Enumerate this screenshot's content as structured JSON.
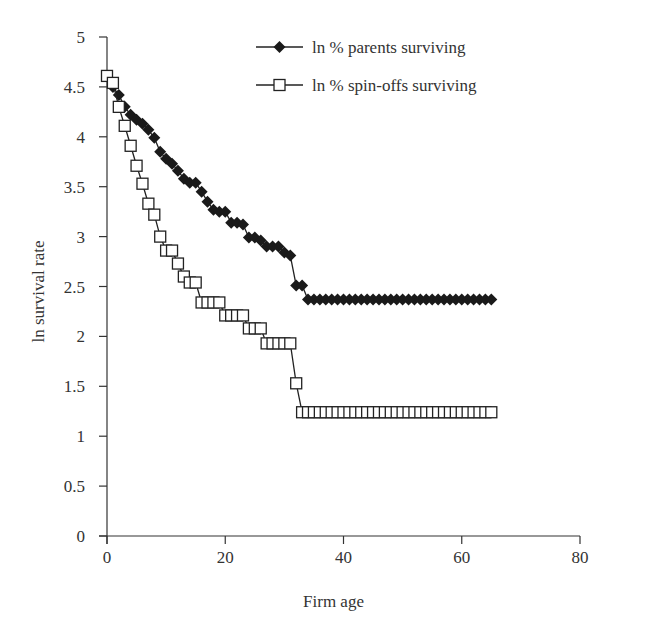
{
  "chart_data": {
    "type": "line",
    "title": "",
    "xlabel": "Firm age",
    "ylabel": "ln survival rate",
    "xlim": [
      0,
      80
    ],
    "ylim": [
      0,
      5
    ],
    "x_ticks": [
      0,
      20,
      40,
      60,
      80
    ],
    "x_tick_labels": [
      "0",
      "20",
      "40",
      "60",
      "80"
    ],
    "y_ticks": [
      0,
      0.5,
      1,
      1.5,
      2,
      2.5,
      3,
      3.5,
      4,
      4.5,
      5
    ],
    "y_tick_labels": [
      "0",
      "0.5",
      "1",
      "1.5",
      "2",
      "2.5",
      "3",
      "3.5",
      "4",
      "4.5",
      "5"
    ],
    "grid": false,
    "legend_position": "top-right",
    "x": [
      0,
      1,
      2,
      3,
      4,
      5,
      6,
      7,
      8,
      9,
      10,
      11,
      12,
      13,
      14,
      15,
      16,
      17,
      18,
      19,
      20,
      21,
      22,
      23,
      24,
      25,
      26,
      27,
      28,
      29,
      30,
      31,
      32,
      33,
      34,
      35,
      36,
      37,
      38,
      39,
      40,
      41,
      42,
      43,
      44,
      45,
      46,
      47,
      48,
      49,
      50,
      51,
      52,
      53,
      54,
      55,
      56,
      57,
      58,
      59,
      60,
      61,
      62,
      63,
      64,
      65
    ],
    "series": [
      {
        "name": "ln % parents surviving",
        "marker": "filled-diamond",
        "color": "#1a1a1a",
        "values": [
          4.61,
          4.5,
          4.42,
          4.3,
          4.22,
          4.17,
          4.13,
          4.07,
          3.99,
          3.85,
          3.78,
          3.73,
          3.66,
          3.58,
          3.54,
          3.54,
          3.45,
          3.35,
          3.27,
          3.25,
          3.25,
          3.14,
          3.14,
          3.12,
          2.99,
          2.99,
          2.96,
          2.9,
          2.9,
          2.9,
          2.84,
          2.81,
          2.51,
          2.51,
          2.37,
          2.37,
          2.37,
          2.37,
          2.37,
          2.37,
          2.37,
          2.37,
          2.37,
          2.37,
          2.37,
          2.37,
          2.37,
          2.37,
          2.37,
          2.37,
          2.37,
          2.37,
          2.37,
          2.37,
          2.37,
          2.37,
          2.37,
          2.37,
          2.37,
          2.37,
          2.37,
          2.37,
          2.37,
          2.37,
          2.37,
          2.37
        ]
      },
      {
        "name": "ln % spin-offs surviving",
        "marker": "open-square",
        "color": "#1a1a1a",
        "values": [
          4.61,
          4.54,
          4.3,
          4.11,
          3.91,
          3.71,
          3.53,
          3.33,
          3.22,
          3.0,
          2.86,
          2.86,
          2.73,
          2.6,
          2.54,
          2.54,
          2.34,
          2.34,
          2.34,
          2.34,
          2.21,
          2.21,
          2.21,
          2.21,
          2.08,
          2.08,
          2.08,
          1.93,
          1.93,
          1.93,
          1.93,
          1.93,
          1.53,
          1.24,
          1.24,
          1.24,
          1.24,
          1.24,
          1.24,
          1.24,
          1.24,
          1.24,
          1.24,
          1.24,
          1.24,
          1.24,
          1.24,
          1.24,
          1.24,
          1.24,
          1.24,
          1.24,
          1.24,
          1.24,
          1.24,
          1.24,
          1.24,
          1.24,
          1.24,
          1.24,
          1.24,
          1.24,
          1.24,
          1.24,
          1.24,
          1.24
        ]
      }
    ]
  }
}
